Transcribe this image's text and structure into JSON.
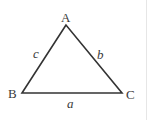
{
  "figure": {
    "type": "triangle",
    "stroke_color": "#333333",
    "background": "#ffffff",
    "vertices": {
      "A": {
        "label": "A",
        "x": 66,
        "y": 25
      },
      "B": {
        "label": "B",
        "x": 22,
        "y": 93
      },
      "C": {
        "label": "C",
        "x": 122,
        "y": 93
      }
    },
    "sides": {
      "a": {
        "label": "a",
        "between": "B-C"
      },
      "b": {
        "label": "b",
        "between": "A-C"
      },
      "c": {
        "label": "c",
        "between": "A-B"
      }
    }
  }
}
